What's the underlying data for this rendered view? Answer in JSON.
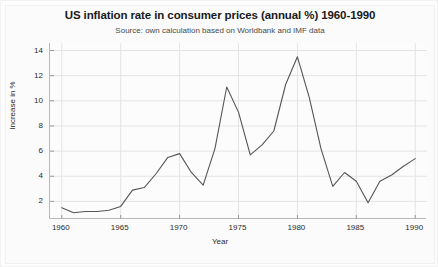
{
  "chart_data": {
    "type": "line",
    "title": "US inflation rate in consumer prices (annual %) 1960-1990",
    "subtitle": "Source: own calculation based on Worldbank and IMF data",
    "xlabel": "Year",
    "ylabel": "Increase in %",
    "xlim": [
      1959,
      1991
    ],
    "ylim": [
      0.6,
      14.6
    ],
    "xticks": [
      "1960",
      "1965",
      "1970",
      "1975",
      "1980",
      "1985",
      "1990"
    ],
    "xtick_values": [
      1960,
      1965,
      1970,
      1975,
      1980,
      1985,
      1990
    ],
    "yticks": [
      "2",
      "4",
      "6",
      "8",
      "10",
      "12",
      "14"
    ],
    "ytick_values": [
      2,
      4,
      6,
      8,
      10,
      12,
      14
    ],
    "grid": true,
    "legend": null,
    "line_color": "#555555",
    "x": [
      1960,
      1961,
      1962,
      1963,
      1964,
      1965,
      1966,
      1967,
      1968,
      1969,
      1970,
      1971,
      1972,
      1973,
      1974,
      1975,
      1976,
      1977,
      1978,
      1979,
      1980,
      1981,
      1982,
      1983,
      1984,
      1985,
      1986,
      1987,
      1988,
      1989,
      1990
    ],
    "values": [
      1.5,
      1.1,
      1.2,
      1.2,
      1.3,
      1.6,
      2.9,
      3.1,
      4.2,
      5.5,
      5.8,
      4.3,
      3.3,
      6.2,
      11.1,
      9.1,
      5.7,
      6.5,
      7.6,
      11.3,
      13.5,
      10.3,
      6.2,
      3.2,
      4.3,
      3.6,
      1.9,
      3.6,
      4.1,
      4.8,
      5.4
    ],
    "series_name": "US inflation rate"
  }
}
